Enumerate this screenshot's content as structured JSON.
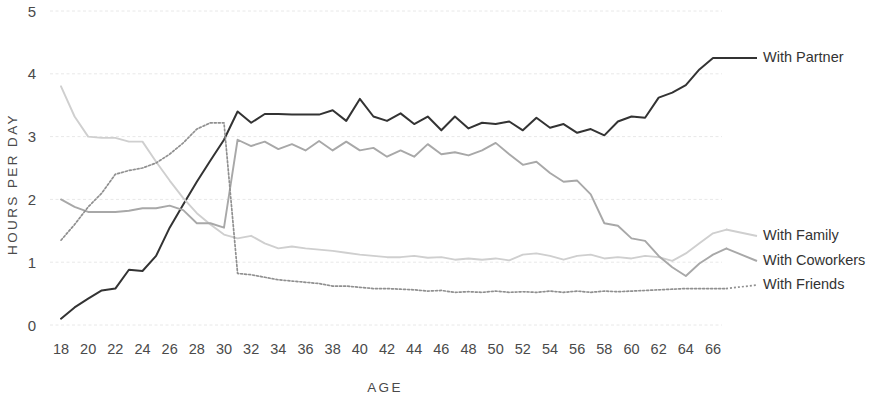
{
  "chart_data": {
    "type": "line",
    "title": "",
    "xlabel": "AGE",
    "ylabel": "HOURS PER DAY",
    "xlim": [
      18,
      67
    ],
    "ylim": [
      0,
      5
    ],
    "grid": true,
    "legend_position": "right-inline",
    "y_ticks": [
      "0",
      "1",
      "2",
      "3",
      "4",
      "5"
    ],
    "y_tick_values": [
      0,
      1,
      2,
      3,
      4,
      5
    ],
    "x_ticks": [
      "18",
      "20",
      "22",
      "24",
      "26",
      "28",
      "30",
      "32",
      "34",
      "36",
      "38",
      "40",
      "42",
      "44",
      "46",
      "48",
      "50",
      "52",
      "54",
      "56",
      "58",
      "60",
      "62",
      "64",
      "66"
    ],
    "x_tick_values": [
      18,
      20,
      22,
      24,
      26,
      28,
      30,
      32,
      34,
      36,
      38,
      40,
      42,
      44,
      46,
      48,
      50,
      52,
      54,
      56,
      58,
      60,
      62,
      64,
      66
    ],
    "x": [
      18,
      19,
      20,
      21,
      22,
      23,
      24,
      25,
      26,
      27,
      28,
      29,
      30,
      31,
      32,
      33,
      34,
      35,
      36,
      37,
      38,
      39,
      40,
      41,
      42,
      43,
      44,
      45,
      46,
      47,
      48,
      49,
      50,
      51,
      52,
      53,
      54,
      55,
      56,
      57,
      58,
      59,
      60,
      61,
      62,
      63,
      64,
      65,
      66,
      67
    ],
    "series": [
      {
        "name": "With Partner",
        "color": "#333333",
        "width": 2.0,
        "dash": "none",
        "label_x": 67,
        "values": [
          0.1,
          0.28,
          0.42,
          0.55,
          0.58,
          0.88,
          0.86,
          1.1,
          1.55,
          1.92,
          2.28,
          2.62,
          2.95,
          3.4,
          3.22,
          3.36,
          3.36,
          3.35,
          3.35,
          3.35,
          3.42,
          3.25,
          3.6,
          3.32,
          3.25,
          3.37,
          3.2,
          3.32,
          3.1,
          3.32,
          3.13,
          3.22,
          3.2,
          3.24,
          3.1,
          3.3,
          3.14,
          3.2,
          3.06,
          3.12,
          3.02,
          3.24,
          3.32,
          3.3,
          3.62,
          3.7,
          3.82,
          4.07,
          4.25,
          4.25
        ]
      },
      {
        "name": "With Family",
        "color": "#cfcfcf",
        "width": 1.9,
        "dash": "none",
        "label_x": 67,
        "values": [
          3.8,
          3.32,
          3.0,
          2.98,
          2.98,
          2.92,
          2.92,
          2.6,
          2.3,
          2.02,
          1.78,
          1.6,
          1.44,
          1.38,
          1.42,
          1.3,
          1.22,
          1.25,
          1.22,
          1.2,
          1.18,
          1.15,
          1.12,
          1.1,
          1.08,
          1.08,
          1.1,
          1.07,
          1.08,
          1.04,
          1.06,
          1.04,
          1.06,
          1.03,
          1.12,
          1.14,
          1.1,
          1.04,
          1.1,
          1.12,
          1.06,
          1.08,
          1.06,
          1.1,
          1.08,
          1.02,
          1.14,
          1.3,
          1.46,
          1.52
        ]
      },
      {
        "name": "With  Coworkers",
        "color": "#a8a8a8",
        "width": 1.9,
        "dash": "none",
        "label_x": 67,
        "values": [
          2.0,
          1.88,
          1.8,
          1.8,
          1.8,
          1.82,
          1.86,
          1.86,
          1.9,
          1.83,
          1.62,
          1.62,
          1.55,
          2.95,
          2.85,
          2.92,
          2.8,
          2.88,
          2.78,
          2.93,
          2.78,
          2.92,
          2.78,
          2.82,
          2.68,
          2.78,
          2.68,
          2.88,
          2.72,
          2.75,
          2.7,
          2.78,
          2.9,
          2.72,
          2.55,
          2.6,
          2.42,
          2.28,
          2.3,
          2.08,
          1.62,
          1.58,
          1.38,
          1.34,
          1.1,
          0.92,
          0.78,
          0.98,
          1.12,
          1.22
        ]
      },
      {
        "name": "With Friends",
        "color": "#909090",
        "width": 1.7,
        "dash": "2 2",
        "label_x": 67,
        "values": [
          1.35,
          1.6,
          1.88,
          2.1,
          2.4,
          2.46,
          2.5,
          2.58,
          2.72,
          2.9,
          3.12,
          3.22,
          3.22,
          0.82,
          0.8,
          0.76,
          0.72,
          0.7,
          0.68,
          0.66,
          0.62,
          0.62,
          0.6,
          0.58,
          0.58,
          0.57,
          0.56,
          0.54,
          0.55,
          0.52,
          0.53,
          0.52,
          0.54,
          0.52,
          0.53,
          0.52,
          0.54,
          0.52,
          0.54,
          0.52,
          0.54,
          0.53,
          0.54,
          0.55,
          0.56,
          0.57,
          0.58,
          0.58,
          0.58,
          0.58
        ]
      }
    ],
    "legend": [
      {
        "label": "With Partner",
        "color": "#333333",
        "dash": "none"
      },
      {
        "label": "With Family",
        "color": "#cfcfcf",
        "dash": "none"
      },
      {
        "label": "With  Coworkers",
        "color": "#a8a8a8",
        "dash": "none"
      },
      {
        "label": "With Friends",
        "color": "#909090",
        "dash": "2 2"
      }
    ]
  }
}
